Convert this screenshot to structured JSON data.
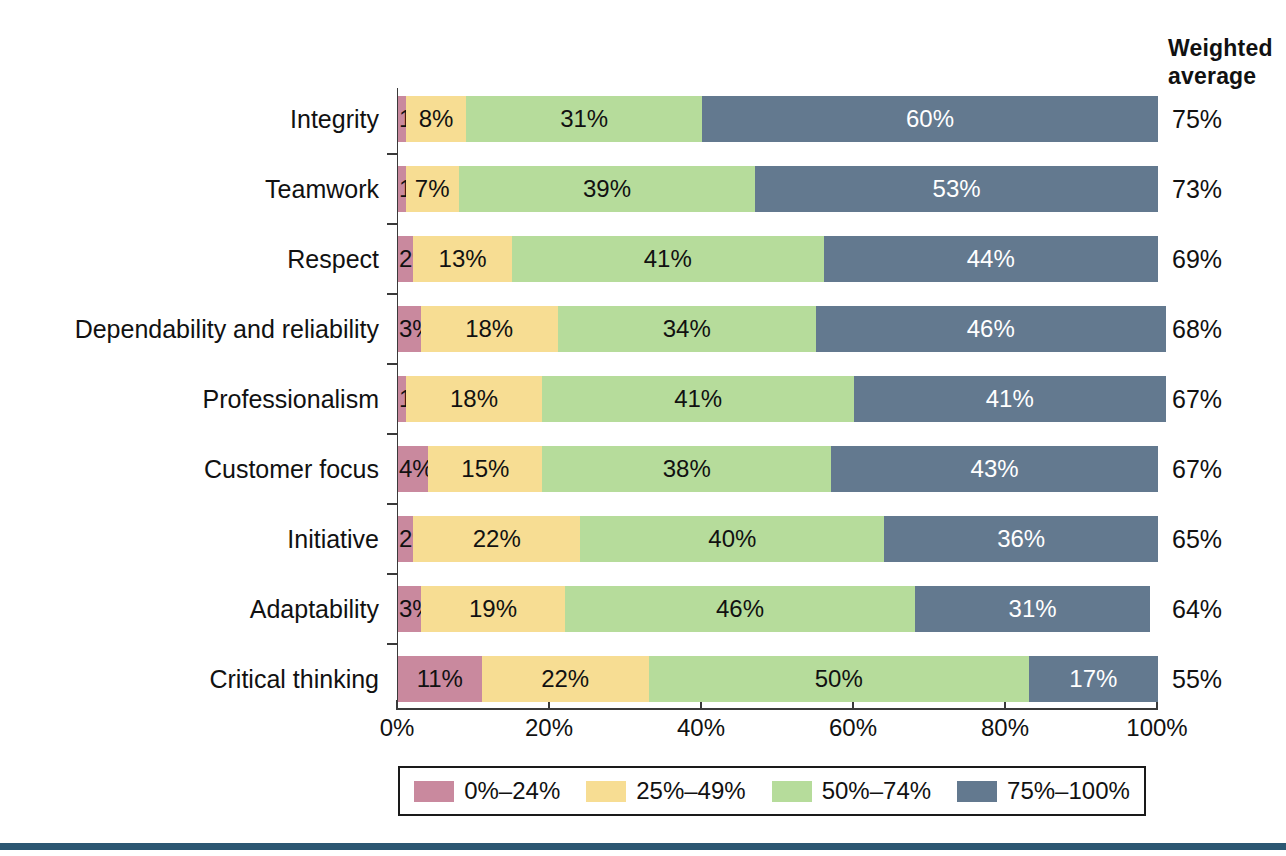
{
  "header": {
    "line1": "Weighted",
    "line2": "average"
  },
  "colors": {
    "band_0_24": "#c9899e",
    "band_25_49": "#f7dd93",
    "band_50_74": "#b6dc9b",
    "band_75_100": "#63798f",
    "axis": "#3a3a3a",
    "text": "#111111",
    "bottom_rule": "#2c5772"
  },
  "legend": {
    "items": [
      {
        "label": "0%–24%",
        "color_key": "band_0_24"
      },
      {
        "label": "25%–49%",
        "color_key": "band_25_49"
      },
      {
        "label": "50%–74%",
        "color_key": "band_50_74"
      },
      {
        "label": "75%–100%",
        "color_key": "band_75_100"
      }
    ]
  },
  "chart_data": {
    "type": "bar",
    "orientation": "horizontal",
    "stacked": true,
    "stack_mode": "percent",
    "title": "",
    "xlabel": "",
    "ylabel": "",
    "xlim": [
      0,
      100
    ],
    "xticks": [
      0,
      20,
      40,
      60,
      80,
      100
    ],
    "xtick_labels": [
      "0%",
      "20%",
      "40%",
      "60%",
      "80%",
      "100%"
    ],
    "grid": false,
    "legend_position": "bottom",
    "series": [
      {
        "name": "0%–24%",
        "color": "#c9899e",
        "values": [
          1,
          1,
          2,
          3,
          1,
          4,
          2,
          3,
          11
        ]
      },
      {
        "name": "25%–49%",
        "color": "#f7dd93",
        "values": [
          8,
          7,
          13,
          18,
          18,
          15,
          22,
          19,
          22
        ]
      },
      {
        "name": "50%–74%",
        "color": "#b6dc9b",
        "values": [
          31,
          39,
          41,
          34,
          41,
          38,
          40,
          46,
          50
        ]
      },
      {
        "name": "75%–100%",
        "color": "#63798f",
        "values": [
          60,
          53,
          44,
          46,
          41,
          43,
          36,
          31,
          17
        ]
      }
    ],
    "categories": [
      "Integrity",
      "Teamwork",
      "Respect",
      "Dependability and reliability",
      "Professionalism",
      "Customer focus",
      "Initiative",
      "Adaptability",
      "Critical thinking"
    ],
    "annotations": {
      "weighted_average_label": "Weighted average",
      "weighted_average": [
        75,
        73,
        69,
        68,
        67,
        67,
        65,
        64,
        55
      ]
    }
  },
  "rows": [
    {
      "category": "Integrity",
      "weighted_average": "75%",
      "segments": [
        {
          "label": "1%",
          "value": 1,
          "color_key": "band_0_24",
          "text_color": "#111111"
        },
        {
          "label": "8%",
          "value": 8,
          "color_key": "band_25_49",
          "text_color": "#111111"
        },
        {
          "label": "31%",
          "value": 31,
          "color_key": "band_50_74",
          "text_color": "#111111"
        },
        {
          "label": "60%",
          "value": 60,
          "color_key": "band_75_100",
          "text_color": "#ffffff"
        }
      ]
    },
    {
      "category": "Teamwork",
      "weighted_average": "73%",
      "segments": [
        {
          "label": "1%",
          "value": 1,
          "color_key": "band_0_24",
          "text_color": "#111111"
        },
        {
          "label": "7%",
          "value": 7,
          "color_key": "band_25_49",
          "text_color": "#111111"
        },
        {
          "label": "39%",
          "value": 39,
          "color_key": "band_50_74",
          "text_color": "#111111"
        },
        {
          "label": "53%",
          "value": 53,
          "color_key": "band_75_100",
          "text_color": "#ffffff"
        }
      ]
    },
    {
      "category": "Respect",
      "weighted_average": "69%",
      "segments": [
        {
          "label": "2%",
          "value": 2,
          "color_key": "band_0_24",
          "text_color": "#111111"
        },
        {
          "label": "13%",
          "value": 13,
          "color_key": "band_25_49",
          "text_color": "#111111"
        },
        {
          "label": "41%",
          "value": 41,
          "color_key": "band_50_74",
          "text_color": "#111111"
        },
        {
          "label": "44%",
          "value": 44,
          "color_key": "band_75_100",
          "text_color": "#ffffff"
        }
      ]
    },
    {
      "category": "Dependability and reliability",
      "weighted_average": "68%",
      "segments": [
        {
          "label": "3%",
          "value": 3,
          "color_key": "band_0_24",
          "text_color": "#111111"
        },
        {
          "label": "18%",
          "value": 18,
          "color_key": "band_25_49",
          "text_color": "#111111"
        },
        {
          "label": "34%",
          "value": 34,
          "color_key": "band_50_74",
          "text_color": "#111111"
        },
        {
          "label": "46%",
          "value": 46,
          "color_key": "band_75_100",
          "text_color": "#ffffff"
        }
      ]
    },
    {
      "category": "Professionalism",
      "weighted_average": "67%",
      "segments": [
        {
          "label": "1%",
          "value": 1,
          "color_key": "band_0_24",
          "text_color": "#111111"
        },
        {
          "label": "18%",
          "value": 18,
          "color_key": "band_25_49",
          "text_color": "#111111"
        },
        {
          "label": "41%",
          "value": 41,
          "color_key": "band_50_74",
          "text_color": "#111111"
        },
        {
          "label": "41%",
          "value": 41,
          "color_key": "band_75_100",
          "text_color": "#ffffff"
        }
      ]
    },
    {
      "category": "Customer focus",
      "weighted_average": "67%",
      "segments": [
        {
          "label": "4%",
          "value": 4,
          "color_key": "band_0_24",
          "text_color": "#111111"
        },
        {
          "label": "15%",
          "value": 15,
          "color_key": "band_25_49",
          "text_color": "#111111"
        },
        {
          "label": "38%",
          "value": 38,
          "color_key": "band_50_74",
          "text_color": "#111111"
        },
        {
          "label": "43%",
          "value": 43,
          "color_key": "band_75_100",
          "text_color": "#ffffff"
        }
      ]
    },
    {
      "category": "Initiative",
      "weighted_average": "65%",
      "segments": [
        {
          "label": "2%",
          "value": 2,
          "color_key": "band_0_24",
          "text_color": "#111111"
        },
        {
          "label": "22%",
          "value": 22,
          "color_key": "band_25_49",
          "text_color": "#111111"
        },
        {
          "label": "40%",
          "value": 40,
          "color_key": "band_50_74",
          "text_color": "#111111"
        },
        {
          "label": "36%",
          "value": 36,
          "color_key": "band_75_100",
          "text_color": "#ffffff"
        }
      ]
    },
    {
      "category": "Adaptability",
      "weighted_average": "64%",
      "segments": [
        {
          "label": "3%",
          "value": 3,
          "color_key": "band_0_24",
          "text_color": "#111111"
        },
        {
          "label": "19%",
          "value": 19,
          "color_key": "band_25_49",
          "text_color": "#111111"
        },
        {
          "label": "46%",
          "value": 46,
          "color_key": "band_50_74",
          "text_color": "#111111"
        },
        {
          "label": "31%",
          "value": 31,
          "color_key": "band_75_100",
          "text_color": "#ffffff"
        }
      ]
    },
    {
      "category": "Critical thinking",
      "weighted_average": "55%",
      "segments": [
        {
          "label": "11%",
          "value": 11,
          "color_key": "band_0_24",
          "text_color": "#111111"
        },
        {
          "label": "22%",
          "value": 22,
          "color_key": "band_25_49",
          "text_color": "#111111"
        },
        {
          "label": "50%",
          "value": 50,
          "color_key": "band_50_74",
          "text_color": "#111111"
        },
        {
          "label": "17%",
          "value": 17,
          "color_key": "band_75_100",
          "text_color": "#ffffff"
        }
      ]
    }
  ]
}
